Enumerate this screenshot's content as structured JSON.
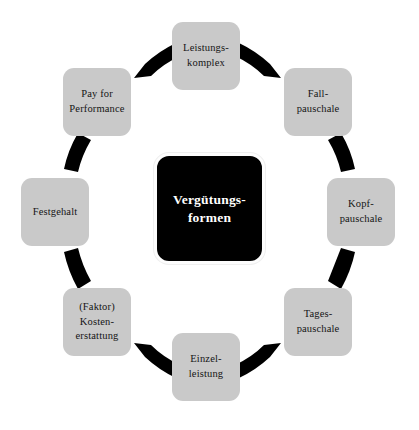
{
  "diagram": {
    "type": "cycle-diagram",
    "center": {
      "label": "Vergütungs-\nformen",
      "fill_color": "#000000",
      "text_color": "#ffffff"
    },
    "node_fill_color": "#c9c9c9",
    "node_text_color": "#151515",
    "connector_color": "#000000",
    "background_color": "#ffffff",
    "nodes": [
      {
        "id": "leistungskomplex",
        "label": "Leistungs-\nkomplex",
        "position": "top"
      },
      {
        "id": "fallpauschale",
        "label": "Fall-\npauschale",
        "position": "top-right"
      },
      {
        "id": "kopfpauschale",
        "label": "Kopf-\npauschale",
        "position": "right"
      },
      {
        "id": "tagespauschale",
        "label": "Tages-\npauschale",
        "position": "bottom-right"
      },
      {
        "id": "einzelleistung",
        "label": "Einzel-\nleistung",
        "position": "bottom"
      },
      {
        "id": "kostenerstattung",
        "label": "(Faktor)\nKosten-\nerstattung",
        "position": "bottom-left"
      },
      {
        "id": "festgehalt",
        "label": "Festgehalt",
        "position": "left"
      },
      {
        "id": "payforperformance",
        "label": "Pay for\nPerformance",
        "position": "top-left"
      }
    ]
  }
}
